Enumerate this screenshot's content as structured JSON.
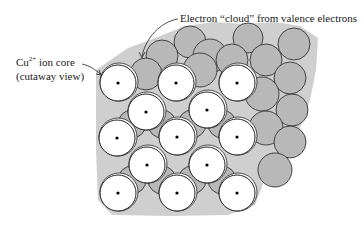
{
  "labels": {
    "cloud": "Electron “cloud” from valence electrons",
    "ion_core_prefix": "Cu",
    "ion_core_charge": "2+",
    "ion_core_suffix": " ion core",
    "cutaway": "(cutaway view)"
  },
  "colors": {
    "cloud": "#c8c8c8",
    "gray_atom": "#b4b4b4",
    "outline": "#222222",
    "ion": "#ffffff"
  },
  "ion_cores": [
    [
      118,
      83
    ],
    [
      176,
      83
    ],
    [
      237,
      83
    ],
    [
      146,
      112
    ],
    [
      207,
      110
    ],
    [
      117,
      138
    ],
    [
      177,
      137
    ],
    [
      237,
      137
    ],
    [
      147,
      165
    ],
    [
      207,
      165
    ],
    [
      118,
      193
    ],
    [
      177,
      193
    ],
    [
      237,
      193
    ]
  ]
}
